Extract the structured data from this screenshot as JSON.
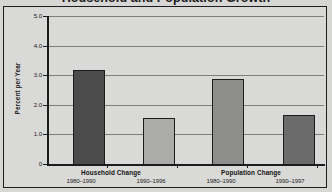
{
  "chart_data": {
    "type": "bar",
    "title": "Household and Population Growth",
    "xlabel": "",
    "ylabel": "Percent per Year",
    "ylim": [
      0,
      5.0
    ],
    "grid": true,
    "legend": "none",
    "categories": [
      "1980–1990",
      "1990–1996",
      "1980–1990",
      "1990–1997"
    ],
    "values": [
      3.2,
      1.6,
      2.9,
      1.7
    ],
    "bar_colors": [
      "#4b4b4b",
      "#ababa9",
      "#8d8d8b",
      "#6b6b6b"
    ],
    "groups": [
      {
        "label": "Household Change",
        "bars": [
          {
            "period": "1980–1990",
            "value": 3.2,
            "color": "#4b4b4b"
          },
          {
            "period": "1990–1996",
            "value": 1.6,
            "color": "#ababa9"
          }
        ]
      },
      {
        "label": "Population Change",
        "bars": [
          {
            "period": "1980–1990",
            "value": 2.9,
            "color": "#8d8d8b"
          },
          {
            "period": "1990–1997",
            "value": 1.7,
            "color": "#6b6b6b"
          }
        ]
      }
    ],
    "y_ticks": [
      "5.0",
      "4.0",
      "3.0",
      "2.0",
      "1.0",
      "0"
    ],
    "y_tick_values": [
      5.0,
      4.0,
      3.0,
      2.0,
      1.0,
      0
    ],
    "plot_background": "#d9d9d7",
    "gridline_color": "#7d7d7b",
    "axis_color": "#1c1c1c"
  }
}
